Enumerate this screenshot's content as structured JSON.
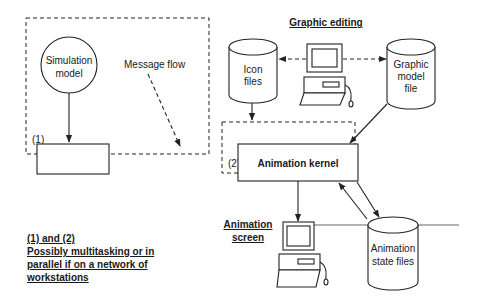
{
  "diagram": {
    "type": "architecture",
    "regions": {
      "region1_label": "(1)",
      "region2_label": "(2)"
    },
    "nodes": {
      "simulation_model": {
        "line1": "Simulation",
        "line2": "model",
        "shape": "circle"
      },
      "simulator": {
        "label": "Simulator",
        "shape": "rectangle"
      },
      "animation_kernel": {
        "label": "Animation kernel",
        "shape": "rectangle"
      },
      "icon_files": {
        "line1": "Icon",
        "line2": "files",
        "shape": "cylinder"
      },
      "graphic_model_file": {
        "line1": "Graphic",
        "line2": "model",
        "line3": "file",
        "shape": "cylinder"
      },
      "animation_state_files": {
        "line1": "Animation",
        "line2": "state files",
        "shape": "cylinder"
      },
      "graphic_editing": {
        "label": "Graphic editing",
        "shape": "computer"
      },
      "animation_screen": {
        "line1": "Animation",
        "line2": "screen",
        "shape": "computer"
      }
    },
    "edge_labels": {
      "message_flow": "Message flow",
      "interactions_line1": "Interactions on",
      "interactions_line2": "the simulator"
    },
    "note": {
      "line1": "(1) and (2)",
      "line2": "Possibly multitasking or in",
      "line3": "parallel if on a network of",
      "line4": "workstations"
    },
    "edges": [
      {
        "from": "Simulation model",
        "to": "Simulator",
        "style": "solid"
      },
      {
        "from": "Simulator",
        "to": "Animation kernel",
        "style": "solid"
      },
      {
        "from": "Animation kernel",
        "to": "Simulator",
        "style": "solid",
        "label": "Interactions on the simulator"
      },
      {
        "from": "Message flow",
        "to": "Simulator-Kernel link",
        "style": "dashed"
      },
      {
        "from": "Graphic editing",
        "to": "Icon files",
        "style": "dashed"
      },
      {
        "from": "Graphic editing",
        "to": "Graphic model file",
        "style": "dashed"
      },
      {
        "from": "Icon files",
        "to": "Animation kernel region",
        "style": "solid"
      },
      {
        "from": "Graphic model file",
        "to": "Animation kernel",
        "style": "solid"
      },
      {
        "from": "Animation kernel",
        "to": "Animation screen",
        "style": "solid"
      },
      {
        "from": "Animation kernel",
        "to": "Animation state files",
        "style": "solid"
      },
      {
        "from": "Animation state files",
        "to": "Animation kernel",
        "style": "solid"
      }
    ]
  }
}
